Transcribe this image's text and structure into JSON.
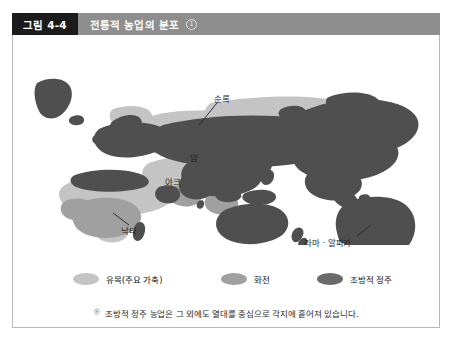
{
  "figure": {
    "number_label": "그림 4-4",
    "title": "전통적 농업의 분포",
    "title_superscript": "1"
  },
  "map": {
    "callouts": [
      {
        "key": "sunrok",
        "label": "순록"
      },
      {
        "key": "yam",
        "label": "얌"
      },
      {
        "key": "yak",
        "label": "야크"
      },
      {
        "key": "nakta",
        "label": "낙타"
      },
      {
        "key": "llama",
        "label": "라마 · 알파카"
      }
    ]
  },
  "legend": {
    "items": [
      {
        "label": "유목(주요 가축)",
        "color": "#c4c4c4"
      },
      {
        "label": "화전",
        "color": "#a0a0a0"
      },
      {
        "label": "조방적 정주",
        "color": "#6b6b6b"
      }
    ]
  },
  "footnote": {
    "marker": "※",
    "text": "조방적 정주 농업은 그 외에도 열대를 중심으로 각지에 흩어져 있습니다."
  },
  "colors": {
    "header_badge_bg": "#1b1b1b",
    "header_title_bg": "#8e8e8e",
    "nomadic": "#c4c4c4",
    "slash_burn": "#a0a0a0",
    "extensive_settled": "#5a5a5a",
    "card_border": "#b9b9b9",
    "page_bg": "#ffffff"
  }
}
